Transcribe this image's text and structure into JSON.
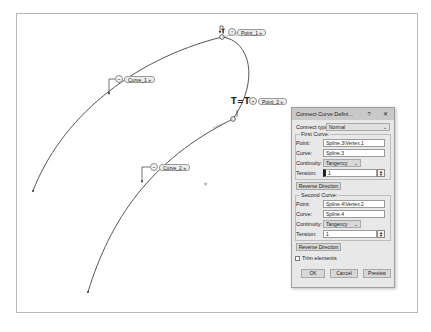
{
  "viewport": {
    "annotations": {
      "point1": {
        "label": "Point_1",
        "icon": "up-arrow-icon"
      },
      "point2": {
        "label": "Point_2",
        "icon": "plus-icon"
      },
      "curve1": {
        "label": "Curve_1",
        "icon": "curve-icon"
      },
      "curve2": {
        "label": "Curve_2",
        "icon": "curve-icon"
      },
      "tangency_marker": "T=T",
      "tag_suffix": "»"
    },
    "origin_marker": "×"
  },
  "dialog": {
    "title": "Connect Curve Defini...",
    "help_icon": "?",
    "close_icon": "✕",
    "connect_type_label": "Connect type :",
    "connect_type_value": "Normal",
    "first_curve": {
      "group_label": "First Curve:",
      "point_label": "Point:",
      "point_value": "Spline.3\\Vertex.1",
      "curve_label": "Curve:",
      "curve_value": "Spline.3",
      "continuity_label": "Continuity:",
      "continuity_value": "Tangency",
      "tension_label": "Tension:",
      "tension_value": "1",
      "reverse_label": "Reverse Direction"
    },
    "second_curve": {
      "group_label": "Second Curve:",
      "point_label": "Point:",
      "point_value": "Spline.4\\Vertex.2",
      "curve_label": "Curve:",
      "curve_value": "Spline.4",
      "continuity_label": "Continuity:",
      "continuity_value": "Tangency",
      "tension_label": "Tension:",
      "tension_value": "1",
      "reverse_label": "Reverse Direction"
    },
    "trim_label": "Trim elements",
    "trim_checked": false,
    "ok_label": "OK",
    "cancel_label": "Cancel",
    "preview_label": "Preview"
  }
}
